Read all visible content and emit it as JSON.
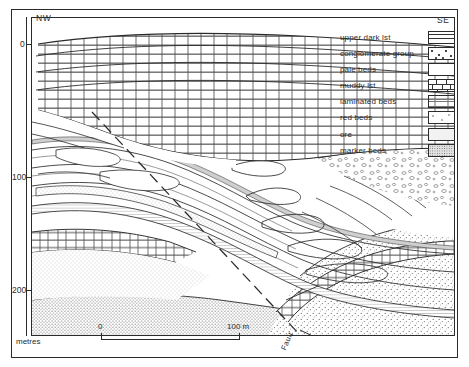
{
  "figure": {
    "type": "geological-cross-section",
    "orientation_left": "NW",
    "orientation_right": "SE",
    "depth_axis_label": "metres",
    "depth_ticks": [
      {
        "label": "0",
        "value": 0
      },
      {
        "label": "100",
        "value": 100
      },
      {
        "label": "200",
        "value": 200
      }
    ],
    "fault_label": "Fault"
  },
  "scalebar": {
    "left_label": "0",
    "right_label": "100 m"
  },
  "legend": {
    "items": [
      {
        "label": "upper dark lst",
        "pattern": "upper-dark-lst"
      },
      {
        "label": "conglomerate group",
        "pattern": "conglomerate"
      },
      {
        "label": "pale beds",
        "pattern": "pale"
      },
      {
        "label": "muddy lst",
        "pattern": "muddy-lst-brick"
      },
      {
        "label": "laminated beds",
        "pattern": "laminated"
      },
      {
        "label": "red beds",
        "pattern": "red-beds-stipple"
      },
      {
        "label": "ore",
        "pattern": "ore-fine-stipple"
      },
      {
        "label": "marker beds",
        "pattern": "marker-dense-stipple"
      }
    ]
  },
  "colors": {
    "ink": "#2b2b2b",
    "paper": "#ffffff",
    "stipple": "#555555",
    "tint": "#f2f2f2"
  }
}
